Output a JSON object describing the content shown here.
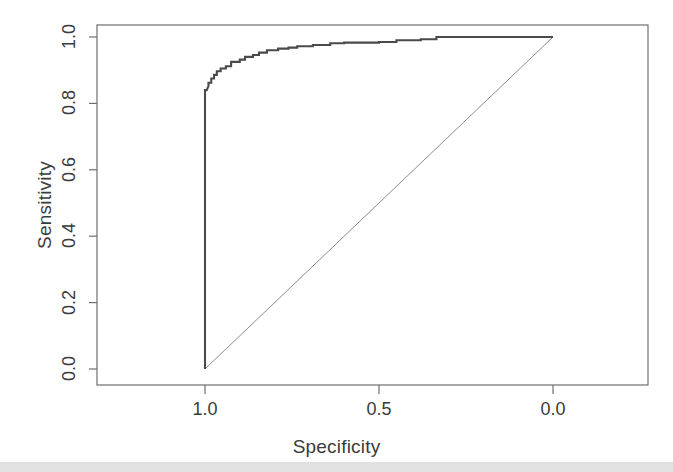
{
  "figure": {
    "width": 673,
    "height": 472,
    "background": "#ffffff",
    "footer_band_color": "#dcdcdc"
  },
  "chart_data": {
    "type": "line",
    "title": "",
    "subtitle": "",
    "xlabel": "Specificity",
    "ylabel": "Sensitivity",
    "xlim": [
      1.0,
      0.0
    ],
    "ylim": [
      0.0,
      1.0
    ],
    "x_axis_reversed": true,
    "grid": false,
    "legend": null,
    "legend_position": "none",
    "xticks": [
      1.0,
      0.5,
      0.0
    ],
    "xtick_labels": [
      "1.0",
      "0.5",
      "0.0"
    ],
    "yticks": [
      0.0,
      0.2,
      0.4,
      0.6,
      0.8,
      1.0
    ],
    "ytick_labels": [
      "0.0",
      "0.2",
      "0.4",
      "0.6",
      "0.8",
      "1.0"
    ],
    "series": [
      {
        "name": "ROC curve",
        "kind": "step",
        "color": "#4a4a4a",
        "line_width": 2.1,
        "x": [
          1.0,
          1.0,
          0.995,
          0.99,
          0.99,
          0.982,
          0.982,
          0.974,
          0.974,
          0.966,
          0.966,
          0.955,
          0.955,
          0.94,
          0.94,
          0.925,
          0.925,
          0.9,
          0.9,
          0.885,
          0.885,
          0.862,
          0.862,
          0.845,
          0.845,
          0.822,
          0.822,
          0.79,
          0.79,
          0.76,
          0.76,
          0.735,
          0.735,
          0.69,
          0.69,
          0.64,
          0.64,
          0.6,
          0.6,
          0.5,
          0.5,
          0.45,
          0.45,
          0.38,
          0.38,
          0.335,
          0.335,
          0.0
        ],
        "y": [
          0.0,
          0.84,
          0.84,
          0.852,
          0.862,
          0.862,
          0.875,
          0.875,
          0.886,
          0.886,
          0.897,
          0.897,
          0.905,
          0.905,
          0.912,
          0.912,
          0.925,
          0.925,
          0.932,
          0.932,
          0.94,
          0.94,
          0.946,
          0.946,
          0.953,
          0.953,
          0.96,
          0.96,
          0.965,
          0.965,
          0.968,
          0.968,
          0.972,
          0.972,
          0.976,
          0.976,
          0.981,
          0.981,
          0.983,
          0.983,
          0.985,
          0.985,
          0.99,
          0.99,
          0.993,
          0.993,
          1.0,
          1.0
        ]
      },
      {
        "name": "chance reference line",
        "kind": "line",
        "color": "#8c8c8c",
        "line_width": 1.0,
        "x": [
          1.0,
          0.0
        ],
        "y": [
          0.0,
          1.0
        ]
      }
    ],
    "annotations": []
  }
}
